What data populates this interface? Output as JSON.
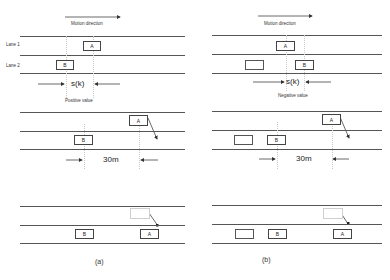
{
  "panels": [
    {
      "id": "a",
      "caption": "(a)",
      "motion_direction_label": "Motion direction",
      "lane_labels": [
        "Lane 1",
        "Lane 2"
      ],
      "gap_symbol": "s(k)",
      "gap_sign_label": "Positive value",
      "distance_label": "30m",
      "stage1": {
        "car_a": "A",
        "car_b": "B"
      },
      "stage2": {
        "car_a": "A",
        "car_b": "B"
      },
      "stage3": {
        "car_a": "A",
        "car_b": "B"
      }
    },
    {
      "id": "b",
      "caption": "(b)",
      "motion_direction_label": "Motion direction",
      "gap_symbol": "s(k)",
      "gap_sign_label": "Negative value",
      "distance_label": "30m",
      "stage1": {
        "car_a": "A",
        "car_b": "B"
      },
      "stage2": {
        "car_a": "A",
        "car_b": "B"
      },
      "stage3": {
        "car_a": "A",
        "car_b": "B"
      }
    }
  ],
  "colors": {
    "line": "#555555",
    "guide": "#c8c8c8",
    "ghost": "#cfcfcf"
  }
}
